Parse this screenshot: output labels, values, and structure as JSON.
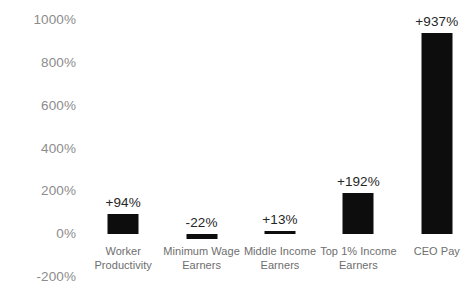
{
  "chart_data": {
    "type": "bar",
    "title": "",
    "subtitle": "",
    "xlabel": "",
    "ylabel": "",
    "categories": [
      "Worker Productivity",
      "Minimum Wage Earners",
      "Middle Income Earners",
      "Top 1% Income Earners",
      "CEO Pay"
    ],
    "category_lines": [
      [
        "Worker",
        "Productivity"
      ],
      [
        "Minimum Wage",
        "Earners"
      ],
      [
        "Middle Income",
        "Earners"
      ],
      [
        "Top 1% Income",
        "Earners"
      ],
      [
        "CEO Pay",
        ""
      ]
    ],
    "values": [
      94,
      -22,
      13,
      192,
      937
    ],
    "value_labels": [
      "+94%",
      "-22%",
      "+13%",
      "+192%",
      "+937%"
    ],
    "ylim": [
      -200,
      1000
    ],
    "ytick_values": [
      1000,
      800,
      600,
      400,
      200,
      0,
      -200
    ],
    "ytick_labels": [
      "1000%",
      "800%",
      "600%",
      "400%",
      "200%",
      "0%",
      "-200%"
    ],
    "grid": false,
    "legend": null,
    "legend_position": "none",
    "bar_color": "#0d0d0d",
    "background_color": "#ffffff",
    "axis_label_color": "#8c8c8c",
    "category_label_color": "#6e6e6e",
    "value_label_color": "#262626"
  }
}
